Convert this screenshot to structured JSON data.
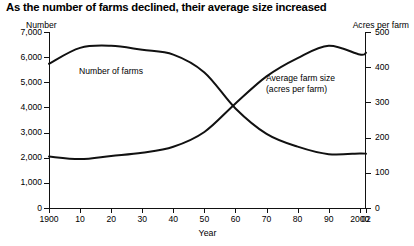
{
  "title": "As the number of farms declined, their average size increased",
  "axes": {
    "left_name": "Number",
    "right_name": "Acres per farm",
    "xlabel": "Year"
  },
  "annotations": {
    "farms": "Number of farms",
    "acres_line1": "Average farm size",
    "acres_line2": "(acres per farm)"
  },
  "chart_data": {
    "type": "line",
    "title": "As the number of farms declined, their average size increased",
    "xlabel": "Year",
    "ylabel": "Number",
    "y2label": "Acres per farm",
    "grid": false,
    "legend": "annotations-inline",
    "x": [
      1900,
      1910,
      1920,
      1930,
      1940,
      1950,
      1960,
      1970,
      1980,
      1990,
      2000,
      2002
    ],
    "xtick_labels": [
      "1900",
      "10",
      "20",
      "30",
      "40",
      "50",
      "60",
      "70",
      "80",
      "90",
      "2000",
      "02"
    ],
    "ylim": [
      0,
      7000
    ],
    "yticks": [
      0,
      1000,
      2000,
      3000,
      4000,
      5000,
      6000,
      7000
    ],
    "ytick_labels": [
      "0",
      "1,000",
      "2,000",
      "3,000",
      "4,000",
      "5,000",
      "6,000",
      "7,000"
    ],
    "y2lim": [
      0,
      500
    ],
    "y2ticks": [
      0,
      100,
      200,
      300,
      400,
      500
    ],
    "y2tick_labels": [
      "0",
      "100",
      "200",
      "300",
      "400",
      "500"
    ],
    "series": [
      {
        "name": "Number of farms",
        "axis": "left",
        "units": "thousands of farms",
        "values": [
          5740,
          6370,
          6450,
          6290,
          6100,
          5390,
          3960,
          2950,
          2440,
          2140,
          2170,
          2160
        ]
      },
      {
        "name": "Average farm size (acres per farm)",
        "axis": "right",
        "units": "acres per farm",
        "values": [
          146,
          139,
          148,
          157,
          174,
          216,
          297,
          374,
          426,
          461,
          436,
          441
        ]
      }
    ],
    "crossover": {
      "year": 1960,
      "farms": 3960,
      "acres": 297
    }
  }
}
